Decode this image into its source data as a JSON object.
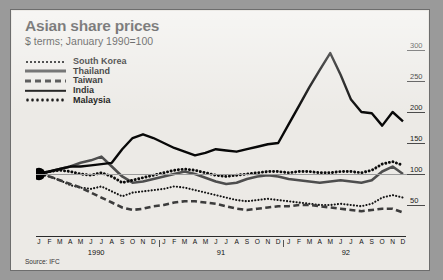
{
  "header": {
    "title": "Asian share prices",
    "subtitle": "$ terms; January 1990=100",
    "source": "Source: IFC"
  },
  "chart_data": {
    "type": "line",
    "title": "Asian share prices",
    "subtitle": "$ terms; January 1990=100",
    "xlabel": "",
    "ylabel": "",
    "ylim": [
      0,
      300
    ],
    "yticks": [
      50,
      100,
      150,
      200,
      250,
      300
    ],
    "grid": false,
    "baseline_gridline": 100,
    "legend_position": "top-left",
    "source": "Source: IFC",
    "month_labels": [
      "J",
      "F",
      "M",
      "A",
      "M",
      "J",
      "J",
      "A",
      "S",
      "O",
      "N",
      "D"
    ],
    "year_labels": [
      "1990",
      "91",
      "92"
    ],
    "x": [
      "1990-01",
      "1990-02",
      "1990-03",
      "1990-04",
      "1990-05",
      "1990-06",
      "1990-07",
      "1990-08",
      "1990-09",
      "1990-10",
      "1990-11",
      "1990-12",
      "1991-01",
      "1991-02",
      "1991-03",
      "1991-04",
      "1991-05",
      "1991-06",
      "1991-07",
      "1991-08",
      "1991-09",
      "1991-10",
      "1991-11",
      "1991-12",
      "1992-01",
      "1992-02",
      "1992-03",
      "1992-04",
      "1992-05",
      "1992-06",
      "1992-07",
      "1992-08",
      "1992-09",
      "1992-10",
      "1992-11",
      "1992-12"
    ],
    "series": [
      {
        "name": "South Korea",
        "style": "fine-dotted",
        "color": "#141414",
        "values": [
          100,
          96,
          90,
          82,
          78,
          76,
          80,
          72,
          64,
          70,
          72,
          74,
          76,
          80,
          78,
          74,
          70,
          66,
          62,
          58,
          56,
          58,
          60,
          58,
          56,
          54,
          52,
          50,
          50,
          52,
          50,
          48,
          52,
          62,
          66,
          62
        ]
      },
      {
        "name": "Thailand",
        "style": "thick-solid",
        "color": "#4e4e4e",
        "values": [
          100,
          104,
          108,
          112,
          118,
          122,
          128,
          112,
          96,
          86,
          88,
          92,
          96,
          100,
          104,
          100,
          94,
          88,
          84,
          86,
          92,
          96,
          98,
          96,
          92,
          90,
          88,
          86,
          88,
          90,
          88,
          86,
          90,
          104,
          112,
          100
        ]
      },
      {
        "name": "Taiwan",
        "style": "dashed",
        "color": "#3c3c3c",
        "values": [
          100,
          96,
          90,
          84,
          78,
          70,
          62,
          54,
          46,
          42,
          44,
          48,
          50,
          54,
          56,
          56,
          54,
          52,
          48,
          44,
          42,
          44,
          46,
          48,
          48,
          50,
          50,
          48,
          46,
          44,
          42,
          40,
          42,
          44,
          44,
          38
        ]
      },
      {
        "name": "India",
        "style": "solid",
        "color": "#080808",
        "values": [
          100,
          104,
          108,
          112,
          112,
          114,
          116,
          118,
          140,
          158,
          164,
          158,
          150,
          142,
          136,
          130,
          134,
          140,
          138,
          136,
          140,
          144,
          148,
          150,
          180,
          210,
          240,
          268,
          295,
          260,
          220,
          200,
          198,
          178,
          200,
          185
        ]
      },
      {
        "name": "Malaysia",
        "style": "bold-dotted",
        "color": "#0c0c0c",
        "values": [
          100,
          104,
          106,
          104,
          100,
          98,
          102,
          96,
          86,
          90,
          94,
          98,
          102,
          106,
          108,
          106,
          102,
          98,
          96,
          98,
          100,
          102,
          104,
          104,
          102,
          104,
          104,
          102,
          102,
          104,
          104,
          102,
          106,
          116,
          120,
          114
        ]
      }
    ]
  }
}
